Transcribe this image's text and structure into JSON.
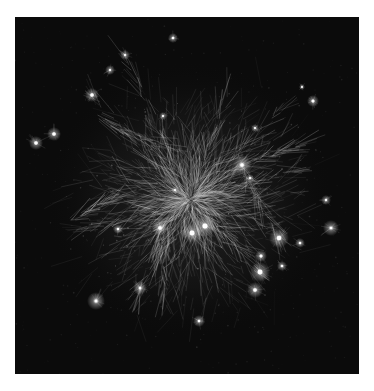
{
  "image": {
    "kind": "network-graph-visualization",
    "background": "#0b0b0b",
    "page_background": "#ffffff",
    "edge_color": "#d8d8d8",
    "node_color": "#ffffff",
    "frame": {
      "x": 15,
      "y": 17,
      "width": 344,
      "height": 357
    },
    "center": {
      "x": 190,
      "y": 200
    },
    "hubs": [
      {
        "x": 36,
        "y": 143,
        "r": 3.0,
        "glow": 7
      },
      {
        "x": 54,
        "y": 134,
        "r": 3.0,
        "glow": 7
      },
      {
        "x": 92,
        "y": 95,
        "r": 3.0,
        "glow": 7
      },
      {
        "x": 173,
        "y": 38,
        "r": 2.2,
        "glow": 5
      },
      {
        "x": 313,
        "y": 101,
        "r": 2.5,
        "glow": 6
      },
      {
        "x": 326,
        "y": 200,
        "r": 2.0,
        "glow": 5
      },
      {
        "x": 331,
        "y": 228,
        "r": 2.2,
        "glow": 8
      },
      {
        "x": 160,
        "y": 228,
        "r": 3.0,
        "glow": 8
      },
      {
        "x": 192,
        "y": 233,
        "r": 4.0,
        "glow": 10
      },
      {
        "x": 205,
        "y": 226,
        "r": 4.2,
        "glow": 11
      },
      {
        "x": 242,
        "y": 165,
        "r": 3.0,
        "glow": 10
      },
      {
        "x": 279,
        "y": 238,
        "r": 3.8,
        "glow": 10
      },
      {
        "x": 261,
        "y": 256,
        "r": 2.5,
        "glow": 6
      },
      {
        "x": 260,
        "y": 272,
        "r": 4.0,
        "glow": 10
      },
      {
        "x": 255,
        "y": 290,
        "r": 3.0,
        "glow": 8
      },
      {
        "x": 282,
        "y": 266,
        "r": 2.2,
        "glow": 5
      },
      {
        "x": 300,
        "y": 243,
        "r": 2.0,
        "glow": 5
      },
      {
        "x": 118,
        "y": 229,
        "r": 2.0,
        "glow": 5
      },
      {
        "x": 96,
        "y": 301,
        "r": 2.5,
        "glow": 9
      },
      {
        "x": 199,
        "y": 321,
        "r": 2.0,
        "glow": 6
      },
      {
        "x": 140,
        "y": 288,
        "r": 2.0,
        "glow": 7
      },
      {
        "x": 163,
        "y": 116,
        "r": 1.8,
        "glow": 4
      },
      {
        "x": 125,
        "y": 55,
        "r": 1.8,
        "glow": 5
      },
      {
        "x": 110,
        "y": 70,
        "r": 1.8,
        "glow": 5
      },
      {
        "x": 255,
        "y": 128,
        "r": 1.6,
        "glow": 4
      },
      {
        "x": 302,
        "y": 87,
        "r": 1.5,
        "glow": 3
      },
      {
        "x": 175,
        "y": 190,
        "r": 1.6,
        "glow": 4
      },
      {
        "x": 250,
        "y": 178,
        "r": 1.8,
        "glow": 4
      }
    ],
    "branches": [
      {
        "from": [
          190,
          200
        ],
        "to": [
          125,
          55
        ]
      },
      {
        "from": [
          190,
          200
        ],
        "to": [
          92,
          95
        ]
      },
      {
        "from": [
          190,
          200
        ],
        "to": [
          242,
          165
        ]
      },
      {
        "from": [
          190,
          200
        ],
        "to": [
          260,
          272
        ]
      },
      {
        "from": [
          190,
          200
        ],
        "to": [
          80,
          230
        ]
      },
      {
        "from": [
          190,
          200
        ],
        "to": [
          160,
          228
        ]
      },
      {
        "from": [
          190,
          200
        ],
        "to": [
          280,
          110
        ]
      },
      {
        "from": [
          190,
          200
        ],
        "to": [
          140,
          290
        ]
      },
      {
        "from": [
          190,
          200
        ],
        "to": [
          300,
          170
        ]
      },
      {
        "from": [
          190,
          200
        ],
        "to": [
          230,
          90
        ]
      },
      {
        "from": [
          242,
          165
        ],
        "to": [
          279,
          238
        ]
      },
      {
        "from": [
          242,
          165
        ],
        "to": [
          300,
          145
        ]
      },
      {
        "from": [
          100,
          120
        ],
        "to": [
          170,
          150
        ]
      },
      {
        "from": [
          70,
          220
        ],
        "to": [
          110,
          200
        ]
      },
      {
        "from": [
          160,
          228
        ],
        "to": [
          165,
          300
        ]
      }
    ],
    "seed": 7,
    "edge_count": 1400,
    "dust_count": 500
  }
}
